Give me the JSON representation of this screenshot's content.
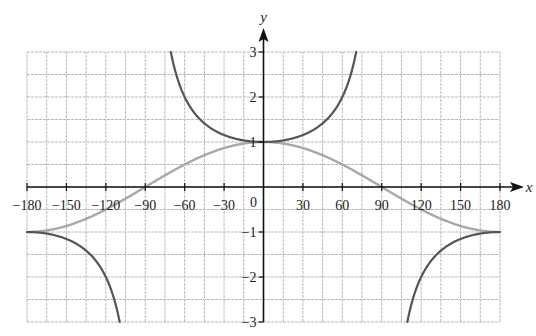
{
  "chart_data": {
    "type": "line",
    "title": "",
    "xlabel": "x",
    "ylabel": "y",
    "xlim": [
      -180,
      180
    ],
    "ylim": [
      -3,
      3
    ],
    "grid": true,
    "grid_minor_x_step": 15,
    "grid_minor_y_step": 0.5,
    "x_ticks": [
      -180,
      -150,
      -120,
      -90,
      -60,
      -30,
      0,
      30,
      60,
      90,
      120,
      150,
      180
    ],
    "x_tick_labels": [
      "−180",
      "−150",
      "−120",
      "−90",
      "−60",
      "−30",
      "0",
      "30",
      "60",
      "90",
      "120",
      "150",
      "180"
    ],
    "y_ticks": [
      -3,
      -2,
      -1,
      1,
      2,
      3
    ],
    "y_tick_labels": [
      "−3",
      "−2",
      "−1",
      "1",
      "2",
      "3"
    ],
    "series": [
      {
        "name": "cos x",
        "function": "cos",
        "color": "#a8a8a8",
        "x": [
          -180,
          -150,
          -120,
          -90,
          -60,
          -30,
          0,
          30,
          60,
          90,
          120,
          150,
          180
        ],
        "values": [
          -1,
          -0.87,
          -0.5,
          0,
          0.5,
          0.87,
          1,
          0.87,
          0.5,
          0,
          -0.5,
          -0.87,
          -1
        ]
      },
      {
        "name": "sec x",
        "function": "sec",
        "color": "#555555",
        "x": [
          -180,
          -150,
          -120,
          -110,
          -70,
          -60,
          -30,
          0,
          30,
          60,
          70,
          110,
          120,
          150,
          180
        ],
        "values": [
          -1,
          -1.15,
          -2,
          -2.92,
          2.92,
          2,
          1.15,
          1,
          1.15,
          2,
          2.92,
          -2.92,
          -2,
          -1.15,
          -1
        ],
        "asymptotes": [
          -90,
          90
        ]
      }
    ],
    "legend": "none"
  }
}
